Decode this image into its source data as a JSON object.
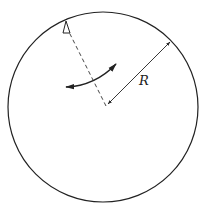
{
  "diagram": {
    "labels": {
      "radius": "R"
    },
    "colors": {
      "stroke": "#222222",
      "background": "#ffffff"
    },
    "elements": [
      {
        "name": "circle",
        "type": "circle"
      },
      {
        "name": "radius-arrow",
        "type": "double-headed arrow",
        "label": "R"
      },
      {
        "name": "dashed-line",
        "type": "dashed line from center to rim marker"
      },
      {
        "name": "rim-marker",
        "type": "small triangle at rim"
      },
      {
        "name": "oscillation-arrow",
        "type": "curved double-headed arrow"
      }
    ]
  }
}
